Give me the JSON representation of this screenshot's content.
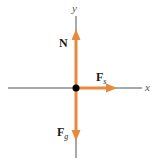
{
  "diagram": {
    "type": "free-body-diagram",
    "axes": {
      "x_label": "x",
      "y_label": "y"
    },
    "forces": [
      {
        "name": "N",
        "label_main": "N",
        "label_sub": "",
        "direction": "up"
      },
      {
        "name": "Fs",
        "label_main": "F",
        "label_sub": "s",
        "direction": "right"
      },
      {
        "name": "Fg",
        "label_main": "F",
        "label_sub": "g",
        "direction": "down"
      }
    ],
    "colors": {
      "arrow": "#E8883A",
      "axis": "#555555",
      "origin": "#000000"
    }
  }
}
